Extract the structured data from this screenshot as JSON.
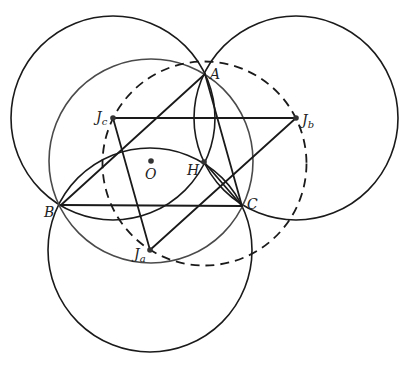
{
  "diagram": {
    "colors": {
      "line": "#1a1a1a",
      "circumcircle": "#4a4a4a",
      "dashed": "#1a1a1a",
      "point": "#333333"
    },
    "points": {
      "A": {
        "x": 205,
        "y": 74,
        "label": "A"
      },
      "B": {
        "x": 61,
        "y": 205,
        "label": "B"
      },
      "C": {
        "x": 242,
        "y": 206,
        "label": "C"
      },
      "H": {
        "x": 204,
        "y": 162,
        "label": "H"
      },
      "O": {
        "x": 151,
        "y": 161,
        "label": "O"
      },
      "Ja": {
        "x": 150,
        "y": 250,
        "label": "J",
        "sub": "a"
      },
      "Jb": {
        "x": 296,
        "y": 118,
        "label": "J",
        "sub": "b"
      },
      "Jc": {
        "x": 113,
        "y": 118,
        "label": "J",
        "sub": "c"
      }
    },
    "circles": [
      {
        "name": "circle-jc",
        "cx": 113,
        "cy": 118,
        "r": 102,
        "style": "solid"
      },
      {
        "name": "circle-jb",
        "cx": 296,
        "cy": 118,
        "r": 102,
        "style": "solid"
      },
      {
        "name": "circle-ja",
        "cx": 150,
        "cy": 250,
        "r": 102,
        "style": "solid"
      },
      {
        "name": "circumcircle",
        "cx": 151,
        "cy": 161,
        "r": 102,
        "style": "gray"
      },
      {
        "name": "circle-excentral",
        "cx": 204.5,
        "cy": 163.5,
        "r": 102,
        "style": "dashed"
      }
    ],
    "segments": [
      {
        "name": "segment-ab",
        "from": "A",
        "to": "B"
      },
      {
        "name": "segment-bc",
        "from": "B",
        "to": "C"
      },
      {
        "name": "segment-ca",
        "from": "C",
        "to": "A"
      },
      {
        "name": "segment-hc",
        "from": "H",
        "to": "C"
      },
      {
        "name": "segment-jcjb",
        "from": "Jc",
        "to": "Jb"
      },
      {
        "name": "segment-jcja",
        "from": "Jc",
        "to": "Ja"
      },
      {
        "name": "segment-jajb",
        "from": "Ja",
        "to": "Jb"
      }
    ],
    "labels": {
      "A": "A",
      "B": "B",
      "C": "C",
      "H": "H",
      "O": "O",
      "Ja": "J",
      "Ja_sub": "a",
      "Jb": "J",
      "Jb_sub": "b",
      "Jc": "J",
      "Jc_sub": "c"
    }
  }
}
